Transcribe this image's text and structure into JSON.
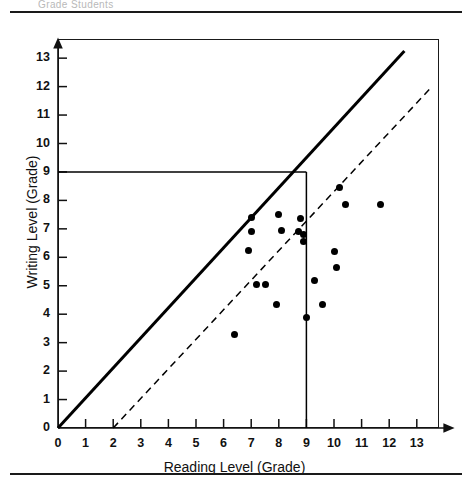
{
  "page": {
    "header_ghost_text": "Grade Students",
    "rule_color": "#1a1a1a"
  },
  "chart_data": {
    "type": "scatter",
    "title": "",
    "xlabel": "Reading Level (Grade)",
    "ylabel": "Writing Level (Grade)",
    "xlim": [
      0,
      13.8
    ],
    "ylim": [
      0,
      13.8
    ],
    "xticks": [
      0,
      1,
      2,
      3,
      4,
      5,
      6,
      7,
      8,
      9,
      10,
      11,
      12,
      13
    ],
    "yticks": [
      0,
      1,
      2,
      3,
      4,
      5,
      6,
      7,
      8,
      9,
      10,
      11,
      12,
      13
    ],
    "xticklabels": [
      "0",
      "1",
      "2",
      "3",
      "4",
      "5",
      "6",
      "7",
      "8",
      "9",
      "10",
      "11",
      "12",
      "13"
    ],
    "yticklabels": [
      "0",
      "1",
      "2",
      "3",
      "4",
      "5",
      "6",
      "7",
      "8",
      "9",
      "10",
      "11",
      "12",
      "13"
    ],
    "grid": false,
    "legend": null,
    "marker_color": "#000000",
    "points": [
      {
        "x": 6.4,
        "y": 3.3
      },
      {
        "x": 7.0,
        "y": 7.4
      },
      {
        "x": 7.0,
        "y": 6.9
      },
      {
        "x": 6.9,
        "y": 6.25
      },
      {
        "x": 7.2,
        "y": 5.05
      },
      {
        "x": 7.5,
        "y": 5.05
      },
      {
        "x": 7.9,
        "y": 4.35
      },
      {
        "x": 8.0,
        "y": 7.5
      },
      {
        "x": 8.1,
        "y": 6.95
      },
      {
        "x": 8.7,
        "y": 6.9
      },
      {
        "x": 8.8,
        "y": 7.35
      },
      {
        "x": 8.9,
        "y": 6.8
      },
      {
        "x": 8.9,
        "y": 6.55
      },
      {
        "x": 9.0,
        "y": 3.9
      },
      {
        "x": 9.3,
        "y": 5.2
      },
      {
        "x": 9.6,
        "y": 4.35
      },
      {
        "x": 10.0,
        "y": 6.2
      },
      {
        "x": 10.1,
        "y": 5.65
      },
      {
        "x": 10.2,
        "y": 8.45
      },
      {
        "x": 10.4,
        "y": 7.85
      },
      {
        "x": 11.7,
        "y": 7.85
      }
    ],
    "reference_lines": [
      {
        "name": "identity-line",
        "style": "solid",
        "width": 3,
        "color": "#000000",
        "from": {
          "x": 0,
          "y": 0
        },
        "to": {
          "x": 12.55,
          "y": 13.25
        }
      },
      {
        "name": "offset-line",
        "style": "dashed",
        "width": 1.5,
        "color": "#000000",
        "from": {
          "x": 2,
          "y": 0
        },
        "to": {
          "x": 13.55,
          "y": 12.0
        }
      },
      {
        "name": "writing-level-9-guide",
        "style": "solid",
        "width": 1.5,
        "color": "#000000",
        "from": {
          "x": 0,
          "y": 9
        },
        "to": {
          "x": 9,
          "y": 9
        }
      },
      {
        "name": "reading-level-9-guide",
        "style": "solid",
        "width": 1.5,
        "color": "#000000",
        "from": {
          "x": 9,
          "y": 9
        },
        "to": {
          "x": 9,
          "y": 0
        }
      }
    ]
  }
}
